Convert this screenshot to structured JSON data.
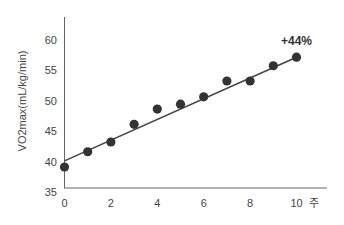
{
  "chart_data": {
    "type": "scatter",
    "title": "",
    "xlabel": "주",
    "ylabel": "VO2max(mL/kg/min)",
    "x": [
      0,
      1,
      2,
      3,
      4,
      5,
      6,
      7,
      8,
      9,
      10
    ],
    "series": [
      {
        "name": "VO2max",
        "marker": "circle",
        "values": [
          39.1,
          41.6,
          43.2,
          46.1,
          48.6,
          49.4,
          50.6,
          53.2,
          53.2,
          55.7,
          57.1
        ]
      }
    ],
    "trendline": {
      "type": "linear",
      "start": {
        "x": 0,
        "y": 40.1
      },
      "end": {
        "x": 10,
        "y": 57.1
      }
    },
    "annotations": [
      {
        "text": "+44%",
        "x": 10,
        "y": 59.5,
        "bold": true
      }
    ],
    "x_ticks": [
      0,
      2,
      4,
      6,
      8,
      10
    ],
    "y_ticks": [
      35,
      40,
      45,
      50,
      55,
      60
    ],
    "xlim": [
      0,
      11.5
    ],
    "ylim": [
      35,
      64
    ],
    "grid": false,
    "legend": "none",
    "colors": {
      "marker": "#333333",
      "line": "#444444",
      "axis": "#666666"
    }
  }
}
